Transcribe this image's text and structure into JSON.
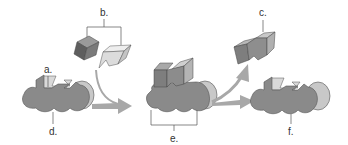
{
  "diagram": {
    "type": "enzyme-substrate reaction cycle",
    "labels": {
      "a": "a.",
      "b": "b.",
      "c": "c.",
      "d": "d.",
      "e": "e.",
      "f": "f."
    },
    "parts": [
      {
        "key": "a",
        "meaning": "active site"
      },
      {
        "key": "b",
        "meaning": "substrates"
      },
      {
        "key": "c",
        "meaning": "product"
      },
      {
        "key": "d",
        "meaning": "enzyme"
      },
      {
        "key": "e",
        "meaning": "enzyme-substrate complex"
      },
      {
        "key": "f",
        "meaning": "enzyme (unchanged)"
      }
    ],
    "colors": {
      "enzyme_body": "#8a8a8a",
      "enzyme_side": "#c8c8c8",
      "active_site": "#d9d9d9",
      "substrate_dark": "#6a6a6a",
      "substrate_dark_top": "#9a9a9a",
      "substrate_light": "#e2e2e2",
      "arrow": "#a8a8a8",
      "line": "#555555",
      "text": "#333333"
    }
  }
}
